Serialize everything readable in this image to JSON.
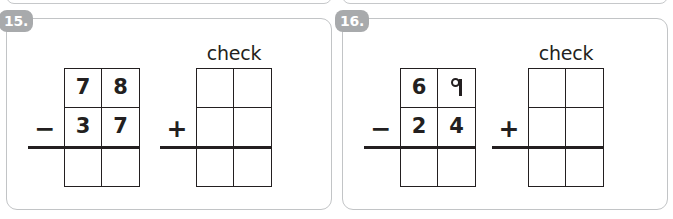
{
  "worksheet": {
    "problems": [
      {
        "number_label": "15.",
        "subtraction": {
          "operator": "−",
          "operator_name": "minus",
          "minuend": [
            "7",
            "8"
          ],
          "subtrahend": [
            "3",
            "7"
          ],
          "answer": [
            "",
            ""
          ]
        },
        "check": {
          "label": "check",
          "operator": "+",
          "operator_name": "plus",
          "addend_one": [
            "",
            ""
          ],
          "addend_two": [
            "",
            ""
          ],
          "answer": [
            "",
            ""
          ]
        }
      },
      {
        "number_label": "16.",
        "subtraction": {
          "operator": "−",
          "operator_name": "minus",
          "minuend": [
            "6",
            "9"
          ],
          "subtrahend": [
            "2",
            "4"
          ],
          "answer": [
            "",
            ""
          ]
        },
        "check": {
          "label": "check",
          "operator": "+",
          "operator_name": "plus",
          "addend_one": [
            "",
            ""
          ],
          "addend_two": [
            "",
            ""
          ],
          "answer": [
            "",
            ""
          ]
        }
      }
    ],
    "colors": {
      "badge_background": "#a8aaac",
      "badge_text": "#ffffff",
      "card_border": "#c2c4c6",
      "ink": "#231f20",
      "page_background": "#ffffff"
    }
  }
}
